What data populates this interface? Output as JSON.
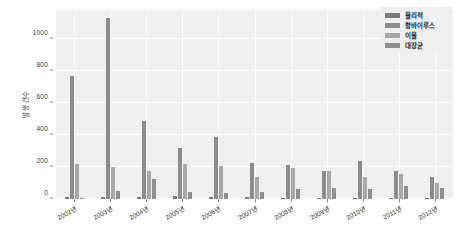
{
  "chart_data": {
    "type": "bar",
    "title": "",
    "xlabel": "",
    "ylabel": "발생 건수",
    "ylim": [
      0,
      1180
    ],
    "yticks": [
      0,
      200,
      400,
      600,
      800,
      1000
    ],
    "ytick_labels": [
      "0",
      "200",
      "400",
      "600",
      "800",
      "1000"
    ],
    "grid": true,
    "legend_position": "upper right",
    "categories": [
      "2002년",
      "2003년",
      "2004년",
      "2005년",
      "2006년",
      "2007년",
      "2008년",
      "2009년",
      "2010년",
      "2011년",
      "2012년"
    ],
    "series": [
      {
        "name": "물리적",
        "color": "#7a7a7a",
        "values": [
          10,
          10,
          10,
          20,
          10,
          12,
          8,
          5,
          5,
          4,
          3
        ]
      },
      {
        "name": "항바이루스",
        "color": "#8c8c8c",
        "values": [
          770,
          1130,
          490,
          320,
          390,
          225,
          212,
          178,
          235,
          178,
          140
        ]
      },
      {
        "name": "이물",
        "color": "#a8a8a8",
        "values": [
          220,
          200,
          175,
          220,
          205,
          140,
          195,
          172,
          140,
          155,
          100
        ]
      },
      {
        "name": "대장균",
        "color": "#8f8f8f",
        "values": [
          5,
          50,
          125,
          45,
          38,
          45,
          65,
          68,
          60,
          82,
          68
        ]
      }
    ]
  },
  "colors": {
    "plot_background": "#efefef",
    "gridline": "#fdfdfd",
    "figure_background": "#ffffff",
    "axis_text": "#2e2e2e"
  }
}
